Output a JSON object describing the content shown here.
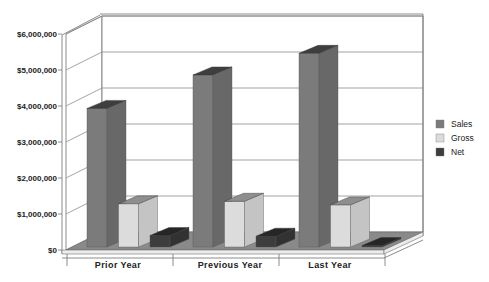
{
  "chart_data": {
    "type": "bar",
    "subtype": "3d-clustered-column",
    "title": "",
    "xlabel": "",
    "ylabel": "",
    "categories": [
      "Prior Year",
      "Previous Year",
      "Last Year"
    ],
    "series": [
      {
        "name": "Sales",
        "values": [
          3850000,
          4780000,
          5380000
        ],
        "color": "#7b7b7b",
        "side": "#686868",
        "top": "#3e3e3e"
      },
      {
        "name": "Gross",
        "values": [
          1200000,
          1270000,
          1170000
        ],
        "color": "#dcdcdc",
        "side": "#c4c4c4",
        "top": "#8e8e8e"
      },
      {
        "name": "Net",
        "values": [
          320000,
          300000,
          40000
        ],
        "color": "#3d3d3d",
        "side": "#323232",
        "top": "#262626"
      }
    ],
    "ylim": [
      0,
      6000000
    ],
    "yticks": [
      0,
      1000000,
      2000000,
      3000000,
      4000000,
      5000000,
      6000000
    ],
    "ytick_labels": [
      "$0",
      "$1,000,000",
      "$2,000,000",
      "$3,000,000",
      "$4,000,000",
      "$5,000,000",
      "$6,000,000"
    ],
    "grid": true,
    "legend_position": "right",
    "colors": {
      "floor": "#8a8a8a",
      "wall": "#ffffff",
      "gridline": "#8c8c8c",
      "axis": "#6e6e6e",
      "slab": "#ececec"
    }
  }
}
